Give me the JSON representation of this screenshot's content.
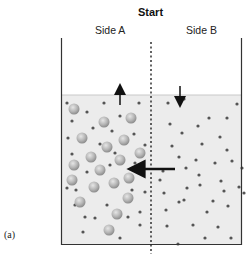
{
  "title": "Start",
  "sides": [
    {
      "label": "Side A"
    },
    {
      "label": "Side B"
    }
  ],
  "figure_label": "(a)",
  "colors": {
    "liquid": "#ececec",
    "container_wall": "#333333",
    "solute_ball": "#b8b8b8",
    "solvent_dot": "#555555",
    "arrow": "#111111"
  },
  "diagram": {
    "container": {
      "left": 61,
      "right": 242,
      "top": 38,
      "bottom": 244,
      "liquid_top_a": 95,
      "liquid_top_b": 95
    },
    "membrane_x": 151,
    "arrows": [
      {
        "name": "side-a-level-up",
        "direction": "up"
      },
      {
        "name": "side-b-level-down",
        "direction": "down"
      },
      {
        "name": "water-flow-b-to-a",
        "direction": "left"
      }
    ],
    "solute_particles_side_a": [
      [
        74,
        109
      ],
      [
        104,
        122
      ],
      [
        131,
        118
      ],
      [
        82,
        138
      ],
      [
        124,
        140
      ],
      [
        91,
        157
      ],
      [
        107,
        147
      ],
      [
        140,
        153
      ],
      [
        74,
        165
      ],
      [
        100,
        170
      ],
      [
        120,
        160
      ],
      [
        129,
        178
      ],
      [
        72,
        180
      ],
      [
        94,
        187
      ],
      [
        114,
        183
      ],
      [
        128,
        198
      ],
      [
        80,
        202
      ],
      [
        117,
        214
      ],
      [
        109,
        230
      ]
    ],
    "solvent_dots_side_a": [
      [
        67,
        103
      ],
      [
        87,
        112
      ],
      [
        104,
        103
      ],
      [
        120,
        116
      ],
      [
        139,
        103
      ],
      [
        72,
        121
      ],
      [
        93,
        128
      ],
      [
        112,
        131
      ],
      [
        68,
        138
      ],
      [
        100,
        144
      ],
      [
        134,
        134
      ],
      [
        72,
        154
      ],
      [
        115,
        153
      ],
      [
        145,
        145
      ],
      [
        87,
        172
      ],
      [
        110,
        165
      ],
      [
        135,
        163
      ],
      [
        67,
        188
      ],
      [
        132,
        190
      ],
      [
        75,
        205
      ],
      [
        107,
        205
      ],
      [
        140,
        212
      ],
      [
        85,
        217
      ],
      [
        95,
        218
      ],
      [
        128,
        217
      ],
      [
        140,
        225
      ],
      [
        83,
        232
      ],
      [
        120,
        238
      ],
      [
        76,
        190
      ],
      [
        145,
        192
      ]
    ],
    "solvent_dots_side_b": [
      [
        168,
        103
      ],
      [
        184,
        99
      ],
      [
        209,
        118
      ],
      [
        227,
        118
      ],
      [
        237,
        104
      ],
      [
        170,
        124
      ],
      [
        182,
        133
      ],
      [
        198,
        126
      ],
      [
        220,
        137
      ],
      [
        227,
        150
      ],
      [
        172,
        146
      ],
      [
        202,
        144
      ],
      [
        215,
        163
      ],
      [
        179,
        157
      ],
      [
        232,
        161
      ],
      [
        163,
        171
      ],
      [
        196,
        160
      ],
      [
        221,
        181
      ],
      [
        186,
        168
      ],
      [
        242,
        168
      ],
      [
        164,
        193
      ],
      [
        184,
        200
      ],
      [
        199,
        175
      ],
      [
        224,
        191
      ],
      [
        244,
        193
      ],
      [
        166,
        210
      ],
      [
        179,
        202
      ],
      [
        207,
        212
      ],
      [
        213,
        201
      ],
      [
        228,
        206
      ],
      [
        239,
        187
      ],
      [
        167,
        226
      ],
      [
        193,
        225
      ],
      [
        218,
        227
      ],
      [
        178,
        244
      ],
      [
        205,
        238
      ],
      [
        231,
        238
      ],
      [
        187,
        188
      ],
      [
        160,
        180
      ],
      [
        200,
        185
      ]
    ]
  }
}
